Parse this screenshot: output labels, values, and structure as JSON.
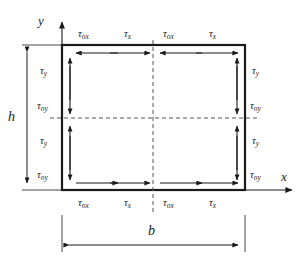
{
  "figure": {
    "type": "shear-stress-distribution-diagram",
    "colors": {
      "line": "#1a1a1a",
      "dashed": "#555555",
      "background": "#ffffff"
    },
    "axes": {
      "y_label": "y",
      "x_label": "x",
      "origin_x": 62,
      "origin_y": 190
    },
    "dimensions": {
      "height_label": "h",
      "width_label": "b"
    },
    "rect": {
      "left": 62,
      "top": 45,
      "right": 245,
      "bottom": 190,
      "center_x": 153,
      "center_y": 118
    },
    "labels": {
      "tau_ox": {
        "sym": "τ",
        "sub": "ox"
      },
      "tau_x": {
        "sym": "τ",
        "sub": "x"
      },
      "tau_y": {
        "sym": "τ",
        "sub": "y"
      },
      "tau_oy": {
        "sym": "τ",
        "sub": "oy"
      }
    },
    "top_edge_labels": [
      "τox",
      "τx",
      "τox",
      "τx"
    ],
    "bottom_edge_labels": [
      "τox",
      "τx",
      "τox",
      "τx"
    ],
    "left_edge_labels": [
      "τy",
      "τoy",
      "τy",
      "τoy"
    ],
    "right_edge_labels": [
      "τy",
      "τoy",
      "τy",
      "τoy"
    ]
  }
}
